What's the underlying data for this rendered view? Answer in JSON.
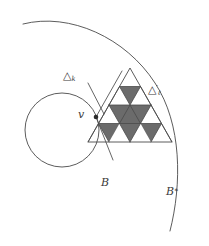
{
  "figure": {
    "background_color": "#ffffff",
    "stroke_color": "#4a4a4a",
    "shade_color": "#6b6b6b",
    "width": 209,
    "height": 246
  },
  "labels": {
    "delta_k": {
      "glyph": "△",
      "sub": "k",
      "sup": "",
      "text": "△k"
    },
    "delta_l_prime": {
      "glyph": "△",
      "sub": "ℓ",
      "sup": "′",
      "text": "△′ℓ"
    },
    "vertex_v": {
      "text": "v"
    },
    "circle_b": {
      "text": "B"
    },
    "circle_b_star": {
      "base": "B",
      "sup": "∗",
      "text": "B∗"
    }
  },
  "geometry": {
    "big_triangle": {
      "apex": [
        130,
        68
      ],
      "left": [
        88,
        142
      ],
      "right": [
        172,
        142
      ],
      "subdivisions": 4,
      "note": "equilateral triangle subdivided into 16 sub-triangles"
    },
    "shaded_cells": [
      {
        "name": "row2-center-inverted",
        "description": "small inverted triangle in second row"
      },
      {
        "name": "central-large-inverted",
        "description": "large inverted triangle spanning rows 3-4"
      },
      {
        "name": "row4-left-inverted",
        "description": "small inverted triangle bottom-left"
      },
      {
        "name": "row4-right-inverted",
        "description": "small inverted triangle bottom-right"
      }
    ],
    "circle_b": {
      "center": [
        62,
        130
      ],
      "radius": 37
    },
    "arc_b_star": {
      "center": [
        74,
        128
      ],
      "radius": 108,
      "start_deg": 205,
      "end_deg": 62
    },
    "marker_v": {
      "point": [
        96,
        117
      ],
      "radius": 2.2
    },
    "leader_line_delta_k": {
      "from": [
        88,
        83
      ],
      "to": [
        104,
        114
      ]
    },
    "small_triangle_delta_k": {
      "apex": [
        96,
        117
      ],
      "edge_up_right": [
        122,
        72
      ],
      "edge_down_right": [
        112,
        158
      ]
    }
  }
}
